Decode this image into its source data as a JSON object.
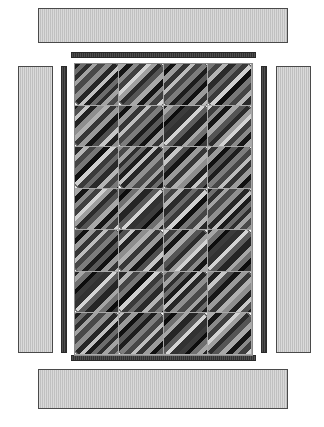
{
  "diagram": {
    "type": "quilt-construction-diagram",
    "background_color": "#ffffff"
  },
  "colors": {
    "page_background": "#ffffff",
    "outer_border_fill": "#c9c9c9",
    "outer_border_stroke": "#4a4a4a",
    "inner_border_fill": "#3b3b3b",
    "inner_border_stroke": "#2a2a2a",
    "center_panel_stroke": "#8a8a8a",
    "grid_line": "#a9a9a9",
    "background_square_light": "#ffffff",
    "background_square_grey": "#ededed",
    "diamond_stroke": "#3a3a3a"
  },
  "outer_borders": [
    {
      "name": "top-outer-border",
      "label": "Top border strip",
      "x": 38,
      "y": 8,
      "width": 250,
      "height": 35
    },
    {
      "name": "left-outer-border",
      "label": "Left border strip",
      "x": 18,
      "y": 66,
      "width": 35,
      "height": 287
    },
    {
      "name": "right-outer-border",
      "label": "Right border strip",
      "x": 276,
      "y": 66,
      "width": 35,
      "height": 287
    },
    {
      "name": "bottom-outer-border",
      "label": "Bottom border strip",
      "x": 38,
      "y": 369,
      "width": 250,
      "height": 40
    }
  ],
  "inner_borders": [
    {
      "name": "top-inner-border",
      "label": "Top inner strip",
      "x": 71,
      "y": 52,
      "width": 185,
      "height": 6
    },
    {
      "name": "left-inner-border",
      "label": "Left inner strip",
      "x": 61,
      "y": 66,
      "width": 6,
      "height": 287
    },
    {
      "name": "right-inner-border",
      "label": "Right inner strip",
      "x": 261,
      "y": 66,
      "width": 6,
      "height": 287
    },
    {
      "name": "bottom-inner-border",
      "label": "Bottom inner strip",
      "x": 71,
      "y": 355,
      "width": 185,
      "height": 6
    }
  ],
  "center_panel": {
    "name": "quilt-center-panel",
    "label": "Quilt center",
    "x": 74,
    "y": 63,
    "width": 179,
    "height": 293,
    "columns": 4,
    "rows": 7,
    "cell_width": 44.75,
    "cell_height": 41.85
  },
  "chart_data": {
    "type": "heatmap",
    "xlabel": "column",
    "ylabel": "row",
    "categories": [
      "col 1",
      "col 2",
      "col 3",
      "col 4"
    ],
    "rows": [
      "row 1",
      "row 2",
      "row 3",
      "row 4",
      "row 5",
      "row 6",
      "row 7"
    ],
    "legend": [
      "striped diamond",
      "light background square",
      "grey background square"
    ],
    "grid": true,
    "cells": [
      [
        {
          "bg": "bg-light",
          "fabric": "f1",
          "dir": "dirA"
        },
        {
          "bg": "bg-white",
          "fabric": "f3",
          "dir": "dirB"
        },
        {
          "bg": "bg-light",
          "fabric": "f2",
          "dir": "dirA"
        },
        {
          "bg": "bg-white",
          "fabric": "f4",
          "dir": "dirB"
        }
      ],
      [
        {
          "bg": "bg-white",
          "fabric": "f5",
          "dir": "dirB"
        },
        {
          "bg": "bg-light",
          "fabric": "f2",
          "dir": "dirA"
        },
        {
          "bg": "bg-white",
          "fabric": "f6",
          "dir": "dirB"
        },
        {
          "bg": "bg-light",
          "fabric": "f3",
          "dir": "dirA"
        }
      ],
      [
        {
          "bg": "bg-light",
          "fabric": "f4",
          "dir": "dirA"
        },
        {
          "bg": "bg-white",
          "fabric": "f1",
          "dir": "dirB"
        },
        {
          "bg": "bg-light",
          "fabric": "f5",
          "dir": "dirA"
        },
        {
          "bg": "bg-white",
          "fabric": "f2",
          "dir": "dirB"
        }
      ],
      [
        {
          "bg": "bg-white",
          "fabric": "f3",
          "dir": "dirB"
        },
        {
          "bg": "bg-light",
          "fabric": "f6",
          "dir": "dirA"
        },
        {
          "bg": "bg-white",
          "fabric": "f4",
          "dir": "dirB"
        },
        {
          "bg": "bg-light",
          "fabric": "f1",
          "dir": "dirA"
        }
      ],
      [
        {
          "bg": "bg-light",
          "fabric": "f2",
          "dir": "dirA"
        },
        {
          "bg": "bg-white",
          "fabric": "f5",
          "dir": "dirB"
        },
        {
          "bg": "bg-light",
          "fabric": "f3",
          "dir": "dirA"
        },
        {
          "bg": "bg-white",
          "fabric": "f6",
          "dir": "dirB"
        }
      ],
      [
        {
          "bg": "bg-white",
          "fabric": "f6",
          "dir": "dirB"
        },
        {
          "bg": "bg-light",
          "fabric": "f4",
          "dir": "dirA"
        },
        {
          "bg": "bg-white",
          "fabric": "f1",
          "dir": "dirB"
        },
        {
          "bg": "bg-light",
          "fabric": "f5",
          "dir": "dirA"
        }
      ],
      [
        {
          "bg": "bg-light",
          "fabric": "f1",
          "dir": "dirA"
        },
        {
          "bg": "bg-white",
          "fabric": "f2",
          "dir": "dirB"
        },
        {
          "bg": "bg-light",
          "fabric": "f6",
          "dir": "dirA"
        },
        {
          "bg": "bg-white",
          "fabric": "f3",
          "dir": "dirB"
        }
      ]
    ]
  }
}
